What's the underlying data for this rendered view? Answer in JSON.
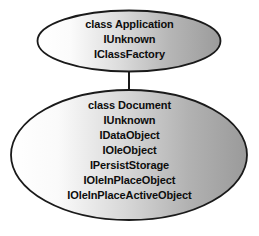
{
  "diagram": {
    "background_color": "#ffffff",
    "outline_color": "#1a1a1a",
    "fill_light": "#ffffff",
    "fill_dark": "#9d9d9d",
    "connector": {
      "name": "application-to-document-connector",
      "color": "#1a1a1a"
    },
    "nodes": [
      {
        "id": "application",
        "shape": "ellipse",
        "lines": [
          "class Application",
          "IUnknown",
          "IClassFactory"
        ]
      },
      {
        "id": "document",
        "shape": "ellipse",
        "lines": [
          "class Document",
          "IUnknown",
          "IDataObject",
          "IOleObject",
          "IPersistStorage",
          "IOleInPlaceObject",
          "IOleInPlaceActiveObject"
        ]
      }
    ]
  }
}
